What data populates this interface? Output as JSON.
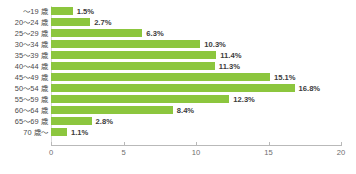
{
  "chart_data": {
    "type": "bar",
    "orientation": "horizontal",
    "title": "",
    "subtitle": "",
    "xlabel": "",
    "ylabel": "",
    "categories": [
      "～19 歳",
      "20～24 歳",
      "25～29 歳",
      "30～34 歳",
      "35～39 歳",
      "40～44 歳",
      "45～49 歳",
      "50～54 歳",
      "55～59 歳",
      "60～64 歳",
      "65～69 歳",
      "70 歳～"
    ],
    "values": [
      1.5,
      2.7,
      6.3,
      10.3,
      11.4,
      11.3,
      15.1,
      16.8,
      12.3,
      8.4,
      2.8,
      1.1
    ],
    "value_labels": [
      "1.5%",
      "2.7%",
      "6.3%",
      "10.3%",
      "11.4%",
      "11.3%",
      "15.1%",
      "16.8%",
      "12.3%",
      "8.4%",
      "2.8%",
      "1.1%"
    ],
    "xlim": [
      0,
      20
    ],
    "xticks": [
      0,
      5,
      10,
      15,
      20
    ],
    "xtick_labels": [
      "0",
      "5",
      "10",
      "15",
      "20"
    ],
    "grid": false,
    "legend": null,
    "bar_color": "#8cc63e",
    "axis_color": "#b9b9b9",
    "label_color": "#4a4a4a",
    "value_label_color": "#3c3c3c"
  }
}
